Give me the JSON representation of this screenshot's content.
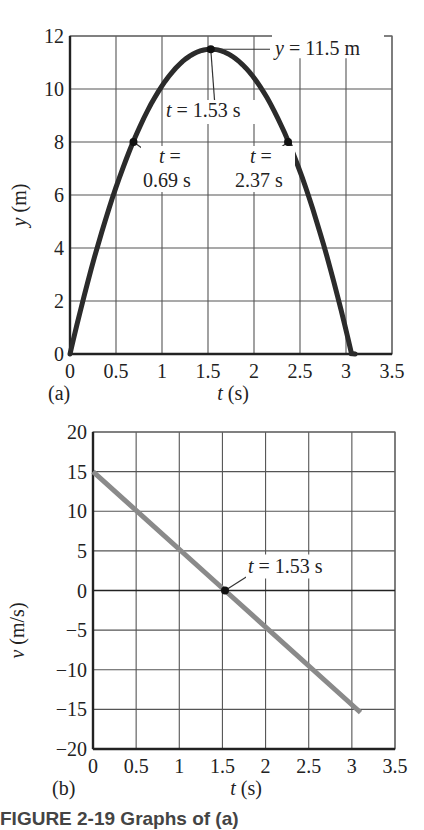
{
  "chart_data": [
    {
      "type": "line",
      "panel_label": "(a)",
      "title": "",
      "xlabel": "t (s)",
      "ylabel": "y (m)",
      "xlim": [
        0,
        3.5
      ],
      "ylim": [
        0,
        12
      ],
      "xticks": [
        "0",
        "0.5",
        "1",
        "1.5",
        "2",
        "2.5",
        "3",
        "3.5"
      ],
      "yticks": [
        "0",
        "2",
        "4",
        "6",
        "8",
        "10",
        "12"
      ],
      "grid": true,
      "series": [
        {
          "name": "y(t)",
          "color": "#2b2b2b",
          "x": [
            0,
            0.25,
            0.5,
            0.69,
            0.75,
            1.0,
            1.25,
            1.53,
            1.75,
            2.0,
            2.25,
            2.37,
            2.5,
            2.75,
            3.0,
            3.06
          ],
          "y": [
            0,
            3.44,
            6.28,
            8.02,
            8.49,
            10.1,
            11.1,
            11.5,
            11.24,
            10.4,
            8.94,
            8.03,
            6.88,
            4.19,
            0.9,
            0
          ]
        }
      ],
      "annotations": [
        {
          "text_var": "y",
          "text_rest": " = 11.5 m",
          "x": 1.53,
          "y": 11.5
        },
        {
          "text_var": "t",
          "text_rest": " = 1.53 s",
          "x": 1.53,
          "y": 11.5
        },
        {
          "line1_var": "t",
          "line1_rest": " =",
          "line2": "0.69 s",
          "x": 0.69,
          "y": 8.0
        },
        {
          "line1_var": "t",
          "line1_rest": " =",
          "line2": "2.37 s",
          "x": 2.37,
          "y": 8.0
        }
      ]
    },
    {
      "type": "line",
      "panel_label": "(b)",
      "title": "",
      "xlabel": "t (s)",
      "ylabel": "v (m/s)",
      "xlim": [
        0,
        3.5
      ],
      "ylim": [
        -20,
        20
      ],
      "xticks": [
        "0",
        "0.5",
        "1",
        "1.5",
        "2",
        "2.5",
        "3",
        "3.5"
      ],
      "yticks": [
        "20",
        "15",
        "10",
        "5",
        "0",
        "−15",
        "−10",
        "−5",
        "−20"
      ],
      "ytick_values": [
        20,
        15,
        10,
        5,
        0,
        -15,
        -10,
        -5,
        -20
      ],
      "grid": true,
      "series": [
        {
          "name": "v(t)",
          "color": "#8a8a8a",
          "x": [
            0,
            1.53,
            3.1
          ],
          "y": [
            15,
            0,
            -15.4
          ]
        }
      ],
      "annotations": [
        {
          "text_var": "t",
          "text_rest": " = 1.53 s",
          "x": 1.53,
          "y": 0
        }
      ]
    }
  ],
  "caption": "FIGURE 2-19  Graphs of (a)"
}
